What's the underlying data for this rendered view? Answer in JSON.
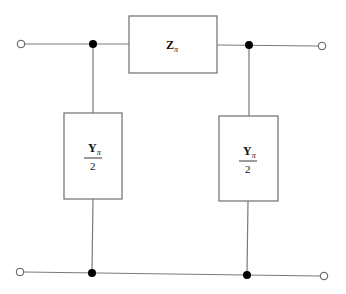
{
  "diagram": {
    "type": "pi-equivalent-circuit",
    "series_element": {
      "symbol": "Z",
      "subscript": "π"
    },
    "shunt_left": {
      "numerator": "Y",
      "subscript": "π",
      "denominator": "2"
    },
    "shunt_right": {
      "numerator": "Y",
      "subscript": "π",
      "denominator": "2"
    },
    "terminals": [
      "input-top",
      "input-bottom",
      "output-top",
      "output-bottom"
    ],
    "nodes": 4,
    "colors": {
      "wire": "#7a7a7a",
      "node": "#000000",
      "background": "#ffffff"
    }
  }
}
